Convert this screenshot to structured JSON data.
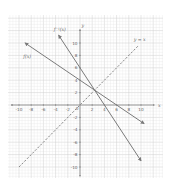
{
  "diagram": {
    "title": "",
    "axes": {
      "x_label": "x",
      "y_label": "y",
      "xlim": [
        -11,
        12
      ],
      "ylim": [
        -11,
        12
      ],
      "x_ticks": [
        -10,
        -8,
        -6,
        -4,
        -2,
        2,
        4,
        6,
        8,
        10
      ],
      "y_ticks": [
        -10,
        -8,
        -6,
        -4,
        -2,
        2,
        4,
        6,
        8,
        10
      ],
      "x_tick_labels": [
        "-10",
        "-8",
        "-6",
        "-4",
        "-2",
        "2",
        "4",
        "6",
        "8",
        "10"
      ],
      "y_tick_labels": [
        "-10",
        "-8",
        "-6",
        "-4",
        "-2",
        "2",
        "4",
        "6",
        "8",
        "10"
      ],
      "origin_label": "0",
      "grid": true
    },
    "curves": [
      {
        "name": "f(x)",
        "label": "f(x)",
        "style": "solid",
        "color": "#7a7a7a",
        "from": [
          -9,
          10
        ],
        "to": [
          10.5,
          -3
        ]
      },
      {
        "name": "f_inverse",
        "label": "f⁻¹(x)",
        "style": "solid",
        "color": "#7a7a7a",
        "from": [
          -3.5,
          11.25
        ],
        "to": [
          10,
          -9
        ]
      },
      {
        "name": "y_equals_x",
        "label": "y = x",
        "style": "dashed",
        "color": "#7a7a7a",
        "from": [
          -10,
          -10
        ],
        "to": [
          9.5,
          9.5
        ]
      }
    ],
    "colors": {
      "grid_minor": "#e6e6e6",
      "grid_major": "#cfcfcf",
      "axis": "#777777",
      "line": "#7a7a7a",
      "text": "#666666"
    }
  },
  "chart_data": {
    "type": "line",
    "title": "",
    "xlabel": "x",
    "ylabel": "y",
    "xlim": [
      -10,
      10
    ],
    "ylim": [
      -10,
      10
    ],
    "grid": true,
    "series": [
      {
        "name": "f(x)",
        "equation": "y = 4 - (2/3)x",
        "x": [
          -9,
          0,
          6,
          10.5
        ],
        "y": [
          10,
          4,
          0,
          -3
        ]
      },
      {
        "name": "f⁻¹(x)",
        "equation": "y = 6 - (3/2)x",
        "x": [
          -3.5,
          0,
          4,
          10
        ],
        "y": [
          11.25,
          6,
          0,
          -9
        ]
      },
      {
        "name": "y = x",
        "equation": "y = x",
        "style": "dashed",
        "x": [
          -10,
          0,
          9.5
        ],
        "y": [
          -10,
          0,
          9.5
        ]
      }
    ],
    "annotations": [
      {
        "text": "f(x)",
        "at": [
          -9,
          7.5
        ]
      },
      {
        "text": "f⁻¹(x)",
        "at": [
          -4,
          12
        ]
      },
      {
        "text": "y = x",
        "at": [
          9,
          10.5
        ]
      },
      {
        "text": "intersection",
        "at": [
          2.4,
          2.4
        ]
      }
    ]
  }
}
